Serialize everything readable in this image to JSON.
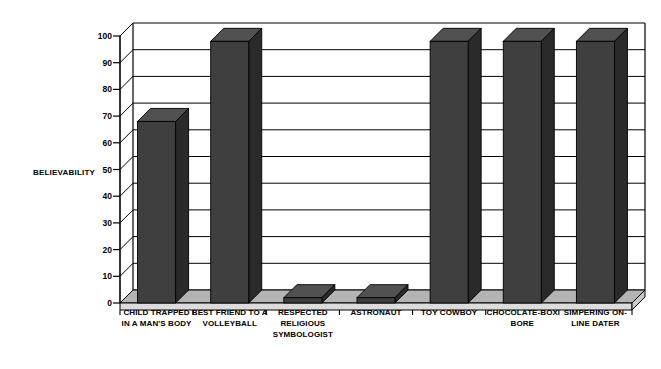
{
  "chart_data": {
    "type": "bar",
    "title": "",
    "subtitle": "",
    "xlabel": "",
    "ylabel": "BELIEVABILITY",
    "ylim": [
      0,
      100
    ],
    "ytick_values": [
      0,
      10,
      20,
      30,
      40,
      50,
      60,
      70,
      80,
      90,
      100
    ],
    "ytick_labels": [
      "0",
      "10",
      "20",
      "30",
      "40",
      "50",
      "60",
      "70",
      "80",
      "90",
      "100"
    ],
    "grid": true,
    "grid_axis": "y",
    "legend": false,
    "legend_position": "none",
    "style": "3d-column",
    "categories": [
      "CHILD TRAPPED IN A MAN'S BODY",
      "BEST FRIEND TO A VOLLEYBALL",
      "RESPECTED RELIGIOUS SYMBOLOGIST",
      "ASTRONAUT",
      "TOY COWBOY",
      "CHOCOLATE-BOX BORE",
      "SIMPERING ON-LINE DATER"
    ],
    "category_label_lines": [
      [
        "CHILD TRAPPED",
        "IN A MAN'S BODY"
      ],
      [
        "BEST FRIEND TO A",
        "VOLLEYBALL"
      ],
      [
        "RESPECTED",
        "RELIGIOUS",
        "SYMBOLOGIST"
      ],
      [
        "ASTRONAUT"
      ],
      [
        "TOY COWBOY"
      ],
      [
        "CHOCOLATE-BOX",
        "BORE"
      ],
      [
        "SIMPERING ON-",
        "LINE DATER"
      ]
    ],
    "values": [
      68,
      98,
      2,
      2,
      98,
      98,
      98
    ],
    "series": [
      {
        "name": "Believability",
        "values": [
          68,
          98,
          2,
          2,
          98,
          98,
          98
        ]
      }
    ],
    "colors": {
      "bar_front": "#3f3f3f",
      "bar_side": "#2a2a2a",
      "bar_top": "#515151",
      "plot_background": "#ffffff",
      "floor": "#b4b4b4",
      "gridline": "#000000",
      "axis": "#000000",
      "text": "#000000"
    }
  }
}
